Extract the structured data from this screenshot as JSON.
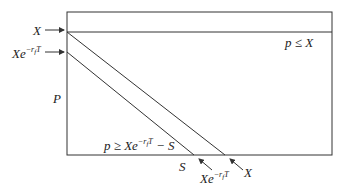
{
  "diagram": {
    "type": "region-diagram",
    "labels": {
      "y_axis": "P",
      "left_top": "X",
      "left_second_base": "Xe",
      "left_second_exp": "−r",
      "left_second_exp_sub": "f",
      "left_second_exp_T": "T",
      "region_top": "p ≤ X",
      "region_bottom_pre": "p ≥ Xe",
      "region_bottom_exp": "−r",
      "region_bottom_exp_sub": "f",
      "region_bottom_exp_T": "T",
      "region_bottom_post": " − S",
      "bottom_s": "S",
      "bottom_mid_base": "Xe",
      "bottom_mid_exp": "−r",
      "bottom_mid_exp_sub": "f",
      "bottom_mid_exp_T": "T",
      "bottom_right": "X"
    },
    "colors": {
      "line": "#333333",
      "text": "#222222"
    }
  }
}
